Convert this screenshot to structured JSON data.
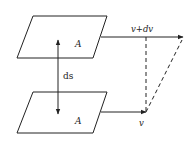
{
  "diagram": {
    "top_plane": {
      "label": "A"
    },
    "bottom_plane": {
      "label": "A"
    },
    "separation": {
      "label": "ds"
    },
    "top_velocity": {
      "label": "v+dv"
    },
    "bottom_velocity": {
      "label": "v"
    },
    "colors": {
      "stroke": "#222222",
      "background": "#ffffff"
    }
  }
}
